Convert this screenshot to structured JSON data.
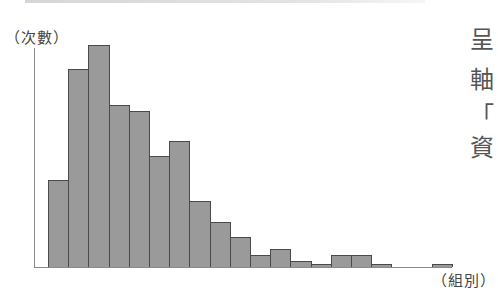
{
  "chart_data": {
    "type": "bar",
    "subtype": "histogram",
    "title": "",
    "xlabel": "（組別）",
    "ylabel": "（次數）",
    "categories": [
      "1",
      "2",
      "3",
      "4",
      "5",
      "6",
      "7",
      "8",
      "9",
      "10",
      "11",
      "12",
      "13",
      "14",
      "15",
      "16",
      "17",
      "18",
      "19",
      "20"
    ],
    "values": [
      29,
      66,
      74,
      54,
      52,
      37,
      42,
      22,
      15,
      10,
      4,
      6,
      2,
      1,
      4,
      4,
      1,
      0,
      0,
      1
    ],
    "ylim": [
      0,
      76
    ],
    "grid": false,
    "legend": null,
    "bar_color": "#9a9a9a",
    "bar_edge_color": "#4a4a4a",
    "axis_color": "#8a8a8a"
  },
  "labels": {
    "y_axis": "（次數）",
    "x_axis": "（組別）"
  },
  "side_text": {
    "chars": [
      "呈",
      "軸",
      "「",
      "資"
    ]
  }
}
